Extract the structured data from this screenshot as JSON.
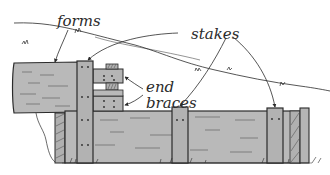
{
  "diagram": {
    "labels": {
      "forms": "forms",
      "stakes": "stakes",
      "end_braces_line1": "end",
      "end_braces_line2": "braces"
    },
    "colors": {
      "wood_fill": "#b9b9b9",
      "wood_dark": "#a8a8a8",
      "outline": "#2b2b2b",
      "grain": "#555555",
      "background": "#ffffff"
    }
  }
}
